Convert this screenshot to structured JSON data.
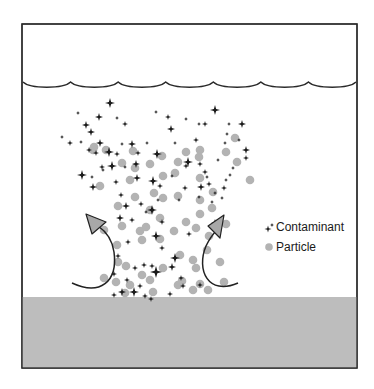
{
  "colors": {
    "frame": "#2a2a2a",
    "ground": "#bdbdbd",
    "particle": "#b3b3b3",
    "contaminant": "#1a1a1a",
    "arrow_fill": "#a8a8a8",
    "arrow_stroke": "#222222"
  },
  "frame": {
    "x": 22,
    "y": 24,
    "w": 335,
    "h": 344
  },
  "ground": {
    "y": 297
  },
  "scallop": {
    "y": 82,
    "x_start": 23,
    "x_end": 356,
    "segments": 7,
    "depth": 5
  },
  "legend": {
    "items": [
      {
        "icon": "contaminant-star-icon",
        "label": "Contaminant"
      },
      {
        "icon": "particle-dot-icon",
        "label": "Particle"
      }
    ]
  },
  "arrows": [
    {
      "name": "left-updraft-arrow",
      "path": "M72,283 C100,296 118,282 114,252 C112,238 104,230 98,226",
      "head": [
        [
          86,
          214
        ],
        [
          92,
          234
        ],
        [
          106,
          222
        ]
      ]
    },
    {
      "name": "right-updraft-arrow",
      "path": "M238,283 C208,296 196,270 206,246 C210,238 214,233 216,231",
      "head": [
        [
          224,
          215
        ],
        [
          208,
          226
        ],
        [
          220,
          238
        ]
      ]
    }
  ],
  "particles": [
    [
      93,
      150
    ],
    [
      133,
      151
    ],
    [
      162,
      156
    ],
    [
      186,
      152
    ],
    [
      200,
      150
    ],
    [
      235,
      138
    ],
    [
      94,
      147
    ],
    [
      106,
      150
    ],
    [
      122,
      163
    ],
    [
      178,
      162
    ],
    [
      199,
      157
    ],
    [
      226,
      152
    ],
    [
      150,
      164
    ],
    [
      130,
      180
    ],
    [
      163,
      176
    ],
    [
      175,
      173
    ],
    [
      135,
      168
    ],
    [
      237,
      162
    ],
    [
      250,
      180
    ],
    [
      200,
      178
    ],
    [
      154,
      193
    ],
    [
      213,
      192
    ],
    [
      100,
      186
    ],
    [
      135,
      197
    ],
    [
      163,
      198
    ],
    [
      178,
      196
    ],
    [
      118,
      206
    ],
    [
      150,
      210
    ],
    [
      160,
      218
    ],
    [
      212,
      208
    ],
    [
      122,
      226
    ],
    [
      140,
      231
    ],
    [
      104,
      230
    ],
    [
      117,
      245
    ],
    [
      142,
      240
    ],
    [
      160,
      239
    ],
    [
      174,
      231
    ],
    [
      196,
      228
    ],
    [
      186,
      222
    ],
    [
      118,
      262
    ],
    [
      126,
      266
    ],
    [
      142,
      275
    ],
    [
      180,
      255
    ],
    [
      193,
      260
    ],
    [
      207,
      250
    ],
    [
      196,
      268
    ],
    [
      104,
      278
    ],
    [
      116,
      282
    ],
    [
      130,
      285
    ],
    [
      150,
      280
    ],
    [
      163,
      268
    ],
    [
      182,
      281
    ],
    [
      200,
      284
    ],
    [
      220,
      262
    ],
    [
      125,
      293
    ],
    [
      153,
      292
    ],
    [
      178,
      285
    ],
    [
      193,
      290
    ],
    [
      208,
      290
    ],
    [
      224,
      282
    ],
    [
      146,
      227
    ],
    [
      200,
      200
    ],
    [
      209,
      236
    ],
    [
      200,
      214
    ],
    [
      226,
      224
    ]
  ],
  "contaminants": [
    [
      110,
      103,
      5
    ],
    [
      215,
      110,
      5
    ],
    [
      78,
      113,
      2
    ],
    [
      99,
      117,
      4
    ],
    [
      117,
      118,
      2
    ],
    [
      125,
      124,
      3
    ],
    [
      86,
      125,
      4
    ],
    [
      156,
      112,
      2
    ],
    [
      168,
      117,
      3
    ],
    [
      186,
      119,
      2
    ],
    [
      199,
      124,
      2
    ],
    [
      205,
      124,
      3
    ],
    [
      229,
      124,
      2
    ],
    [
      242,
      124,
      4
    ],
    [
      91,
      132,
      4
    ],
    [
      171,
      129,
      4
    ],
    [
      227,
      134,
      2
    ],
    [
      62,
      137,
      2
    ],
    [
      70,
      143,
      3
    ],
    [
      81,
      142,
      2
    ],
    [
      100,
      143,
      4
    ],
    [
      122,
      144,
      2
    ],
    [
      132,
      144,
      4
    ],
    [
      147,
      143,
      2
    ],
    [
      175,
      143,
      2
    ],
    [
      196,
      140,
      3
    ],
    [
      239,
      140,
      2
    ],
    [
      246,
      150,
      4
    ],
    [
      89,
      150,
      3
    ],
    [
      109,
      152,
      5
    ],
    [
      138,
      153,
      3
    ],
    [
      157,
      154,
      5
    ],
    [
      218,
      160,
      2
    ],
    [
      188,
      162,
      5
    ],
    [
      200,
      164,
      3
    ],
    [
      225,
      143,
      2
    ],
    [
      246,
      158,
      3
    ],
    [
      112,
      166,
      5
    ],
    [
      96,
      153,
      3
    ],
    [
      117,
      154,
      3
    ],
    [
      102,
      167,
      3
    ],
    [
      136,
      164,
      4
    ],
    [
      186,
      166,
      3
    ],
    [
      205,
      172,
      3
    ],
    [
      233,
      168,
      2
    ],
    [
      230,
      175,
      2
    ],
    [
      82,
      175,
      5
    ],
    [
      103,
      170,
      2
    ],
    [
      125,
      167,
      2
    ],
    [
      92,
      177,
      2
    ],
    [
      137,
      178,
      4
    ],
    [
      153,
      181,
      5
    ],
    [
      172,
      176,
      2
    ],
    [
      207,
      177,
      2
    ],
    [
      209,
      184,
      3
    ],
    [
      226,
      180,
      2
    ],
    [
      224,
      188,
      3
    ],
    [
      215,
      193,
      2
    ],
    [
      212,
      202,
      2
    ],
    [
      185,
      188,
      3
    ],
    [
      160,
      186,
      3
    ],
    [
      121,
      195,
      3
    ],
    [
      116,
      182,
      3
    ],
    [
      158,
      200,
      2
    ],
    [
      152,
      210,
      5
    ],
    [
      126,
      206,
      4
    ],
    [
      93,
      187,
      4
    ],
    [
      146,
      212,
      2
    ],
    [
      201,
      187,
      4
    ],
    [
      215,
      223,
      4
    ],
    [
      162,
      222,
      3
    ],
    [
      156,
      236,
      5
    ],
    [
      189,
      234,
      3
    ],
    [
      179,
      200,
      2
    ],
    [
      199,
      197,
      2
    ],
    [
      222,
      198,
      2
    ],
    [
      120,
      218,
      4
    ],
    [
      132,
      220,
      3
    ],
    [
      141,
      204,
      3
    ],
    [
      162,
      248,
      3
    ],
    [
      175,
      258,
      5
    ],
    [
      152,
      266,
      3
    ],
    [
      135,
      268,
      3
    ],
    [
      118,
      256,
      3
    ],
    [
      128,
      242,
      3
    ],
    [
      183,
      286,
      3
    ],
    [
      156,
      272,
      6
    ],
    [
      144,
      265,
      3
    ],
    [
      172,
      267,
      4
    ],
    [
      140,
      286,
      3
    ],
    [
      134,
      292,
      5
    ],
    [
      122,
      292,
      4
    ],
    [
      114,
      295,
      3
    ],
    [
      145,
      296,
      3
    ],
    [
      151,
      299,
      3
    ],
    [
      170,
      294,
      3
    ],
    [
      200,
      285,
      3
    ],
    [
      181,
      278,
      3
    ],
    [
      127,
      280,
      3
    ],
    [
      114,
      274,
      3
    ]
  ]
}
